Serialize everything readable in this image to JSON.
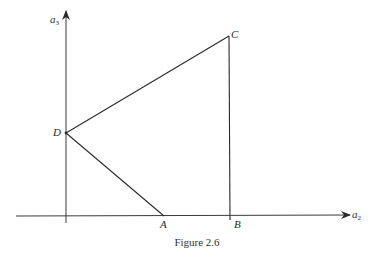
{
  "figure": {
    "caption": "Figure 2.6",
    "axes": {
      "horizontal": {
        "name": "a",
        "subscript": "2"
      },
      "vertical": {
        "name": "a",
        "subscript": "3"
      }
    },
    "points": {
      "A": {
        "label": "A"
      },
      "B": {
        "label": "B"
      },
      "C": {
        "label": "C"
      },
      "D": {
        "label": "D"
      }
    },
    "segments": [
      "D-C",
      "D-A",
      "C-B"
    ],
    "line_color": "#2a2a2a"
  }
}
